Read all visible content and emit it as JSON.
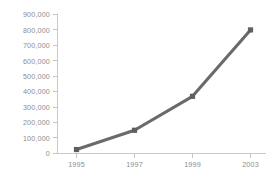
{
  "chart_data": {
    "type": "line",
    "title": "",
    "subtitle": "",
    "xlabel": "",
    "ylabel": "",
    "categories": [
      "1995",
      "1997",
      "1999",
      "2003"
    ],
    "x": [
      1995,
      1997,
      1999,
      2003
    ],
    "values": [
      25000,
      150000,
      370000,
      800000
    ],
    "series": [
      {
        "name": "",
        "values": [
          25000,
          150000,
          370000,
          800000
        ]
      }
    ],
    "ylim": [
      0,
      900000
    ],
    "ytick_values": [
      0,
      100000,
      200000,
      300000,
      400000,
      500000,
      600000,
      700000,
      800000,
      900000
    ],
    "ytick_labels": [
      "0",
      "100,000",
      "200,000",
      "300,000",
      "400,000",
      "500,000",
      "600,000",
      "700,000",
      "800,000",
      "900,000"
    ],
    "xtick_labels": [
      "1995",
      "1997",
      "1999",
      "2003"
    ],
    "grid": false,
    "legend": false,
    "legend_position": "none",
    "marker": "square",
    "colors": {
      "line": "#6a6a6a",
      "marker": "#5f5f5f",
      "axis": "#c9c9c9",
      "tick": "#c4c4c4",
      "label_text": "#8d8d8d",
      "background": "#ffffff"
    }
  }
}
